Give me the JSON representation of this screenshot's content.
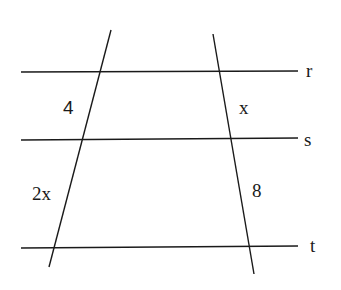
{
  "diagram": {
    "parallel_lines": [
      {
        "name": "r"
      },
      {
        "name": "s"
      },
      {
        "name": "t"
      }
    ],
    "segments": {
      "left_upper": "4",
      "left_lower": "2x",
      "right_upper": "x",
      "right_lower": "8"
    },
    "colors": {
      "stroke": "#1a1a1a",
      "background": "#ffffff"
    }
  }
}
